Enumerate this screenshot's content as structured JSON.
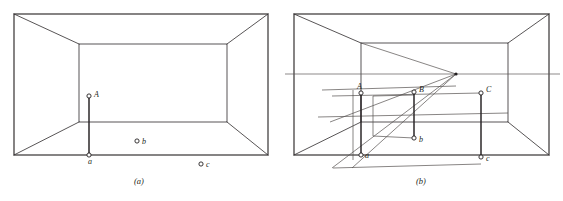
{
  "figure": {
    "title": "",
    "background_color": "#ffffff",
    "line_color": "#231f20",
    "construction_color": "#55504f",
    "width": 563,
    "height": 201,
    "panels": [
      {
        "id": "panel-a",
        "caption": "(a)",
        "caption_x": 139,
        "caption_y": 184,
        "description": "One-point perspective room interior with three free points",
        "outer_rect": {
          "left": 14,
          "top": 14,
          "right": 268,
          "bottom": 155
        },
        "inner_rect": {
          "left": 79,
          "top": 44,
          "right": 227,
          "bottom": 122
        },
        "points": [
          {
            "name": "A",
            "label": "A",
            "x": 89,
            "y": 96,
            "label_dx": 5,
            "label_dy": 1
          },
          {
            "name": "a",
            "label": "a",
            "x": 89,
            "y": 155,
            "label_dx": -1,
            "label_dy": 9
          },
          {
            "name": "b",
            "label": "b",
            "x": 137,
            "y": 141,
            "label_dx": 5,
            "label_dy": 3
          },
          {
            "name": "c",
            "label": "c",
            "x": 201,
            "y": 164,
            "label_dx": 5,
            "label_dy": 3
          }
        ],
        "vertical_connectors": [
          {
            "from": "A",
            "to": "a"
          }
        ]
      },
      {
        "id": "panel-b",
        "caption": "(b)",
        "caption_x": 421,
        "caption_y": 184,
        "description": "Same room with vanishing point, horizon line and perspective construction transferring heights between points A-a, B-b and C-c",
        "outer_rect": {
          "left": 294,
          "top": 14,
          "right": 549,
          "bottom": 155
        },
        "inner_rect": {
          "left": 361,
          "top": 43,
          "right": 508,
          "bottom": 122
        },
        "vanishing_point": {
          "x": 456,
          "y": 74
        },
        "horizon": {
          "x1": 285,
          "x2": 560,
          "y": 74
        },
        "points": [
          {
            "name": "A",
            "label": "A",
            "x": 361,
            "y": 93,
            "label_dx": -2,
            "label_dy": -4
          },
          {
            "name": "a",
            "label": "a",
            "x": 361,
            "y": 155,
            "label_dx": 4,
            "label_dy": 3
          },
          {
            "name": "B",
            "label": "B",
            "x": 414,
            "y": 92,
            "label_dx": 5,
            "label_dy": 0
          },
          {
            "name": "b",
            "label": "b",
            "x": 414,
            "y": 138,
            "label_dx": 5,
            "label_dy": 4
          },
          {
            "name": "C",
            "label": "C",
            "x": 481,
            "y": 93,
            "label_dx": 5,
            "label_dy": -1
          },
          {
            "name": "c",
            "label": "c",
            "x": 481,
            "y": 157,
            "label_dx": 5,
            "label_dy": 4
          }
        ],
        "vertical_connectors": [
          {
            "from": "A",
            "to": "a"
          },
          {
            "from": "B",
            "to": "b"
          },
          {
            "from": "C",
            "to": "c"
          }
        ],
        "construction_lines": [
          {
            "name": "vp-to-inner-top-left",
            "x1": 456,
            "y1": 74,
            "x2": 361,
            "y2": 43
          },
          {
            "name": "vp-to-lower-left",
            "x1": 456,
            "y1": 74,
            "x2": 330,
            "y2": 122
          },
          {
            "name": "vp-through-b-to-ground",
            "x1": 456,
            "y1": 74,
            "x2": 352,
            "y2": 168
          },
          {
            "name": "base-diagonal-rising",
            "x1": 332,
            "y1": 168,
            "x2": 456,
            "y2": 74
          },
          {
            "name": "upper-horizontal-through-A",
            "x1": 322,
            "y1": 90,
            "x2": 456,
            "y2": 86
          },
          {
            "name": "horizontal-through-B-top",
            "x1": 332,
            "y1": 96,
            "x2": 481,
            "y2": 93
          },
          {
            "name": "horizontal-mid",
            "x1": 318,
            "y1": 117,
            "x2": 508,
            "y2": 113
          },
          {
            "name": "horizontal-low",
            "x1": 333,
            "y1": 168,
            "x2": 481,
            "y2": 164
          },
          {
            "name": "vertical-left-aux",
            "x1": 353,
            "y1": 90,
            "x2": 353,
            "y2": 160
          },
          {
            "name": "rect-b-top",
            "x1": 373,
            "y1": 96,
            "x2": 414,
            "y2": 95
          },
          {
            "name": "rect-b-left",
            "x1": 373,
            "y1": 96,
            "x2": 373,
            "y2": 136
          },
          {
            "name": "rect-b-bottom",
            "x1": 373,
            "y1": 136,
            "x2": 414,
            "y2": 138
          }
        ]
      }
    ]
  }
}
